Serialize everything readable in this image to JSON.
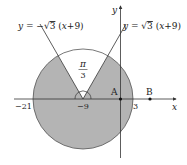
{
  "diagram": {
    "type": "geometry-graph",
    "axes": {
      "x_label": "x",
      "y_label": "y"
    },
    "lines": [
      {
        "id": "left-line",
        "equation_prefix": "y = −",
        "sqrt": "3",
        "equation_suffix": "(x+9)"
      },
      {
        "id": "right-line",
        "equation_prefix": "y = ",
        "sqrt": "3",
        "equation_suffix": "(x+9)"
      }
    ],
    "angle_label": {
      "numerator": "π",
      "denominator": "3"
    },
    "ticks": {
      "left": "−21",
      "center": "−9",
      "right": "3"
    },
    "points": [
      {
        "name": "A",
        "x": 0,
        "y": 0
      },
      {
        "name": "B",
        "x": 7,
        "y": 0
      }
    ],
    "circle": {
      "center_x": -9,
      "center_y": 0,
      "radius": 12
    },
    "colors": {
      "fill": "#b4b4b4",
      "stroke": "#333333",
      "background": "#ffffff"
    }
  }
}
